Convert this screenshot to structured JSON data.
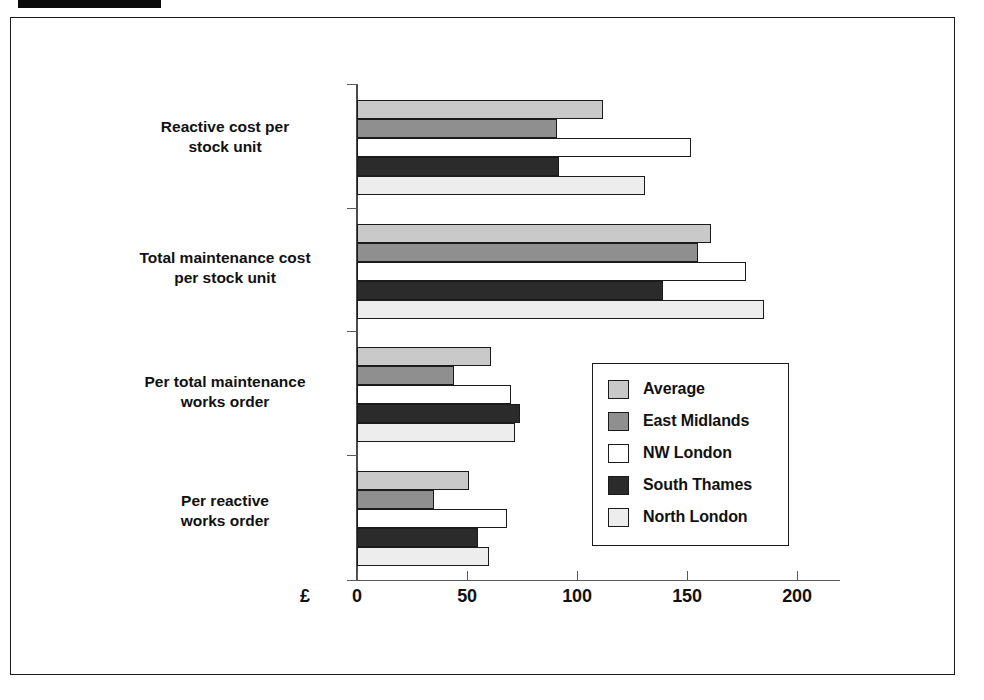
{
  "redaction": {
    "name": "redacted-title-block"
  },
  "chart_data": {
    "type": "bar",
    "orientation": "horizontal",
    "title": "",
    "xlabel": "£",
    "ylabel": "",
    "xlim": [
      0,
      225
    ],
    "grid": false,
    "legend_position": "inside-right",
    "currency_symbol": "£",
    "tick_labels": [
      "0",
      "50",
      "100",
      "150",
      "200"
    ],
    "tick_values": [
      0,
      50,
      100,
      150,
      200
    ],
    "categories": [
      "Reactive cost per stock unit",
      "Total maintenance cost per stock unit",
      "Per total maintenance works order",
      "Per reactive works order"
    ],
    "category_lines": [
      [
        "Reactive cost per",
        "stock unit"
      ],
      [
        "Total maintenance cost",
        "per stock unit"
      ],
      [
        "Per total maintenance",
        "works order"
      ],
      [
        "Per reactive",
        "works order"
      ]
    ],
    "series": [
      {
        "name": "Average",
        "color": "#c9c9c9",
        "values": [
          112,
          161,
          61,
          51
        ]
      },
      {
        "name": "East Midlands",
        "color": "#8f8f8f",
        "values": [
          91,
          155,
          44,
          35
        ]
      },
      {
        "name": "NW London",
        "color": "#ffffff",
        "values": [
          152,
          177,
          70,
          68
        ]
      },
      {
        "name": "South Thames",
        "color": "#2b2b2b",
        "values": [
          92,
          139,
          74,
          55
        ]
      },
      {
        "name": "North London",
        "color": "#ededed",
        "values": [
          131,
          185,
          72,
          60
        ]
      }
    ]
  },
  "legend": {
    "items": [
      {
        "label": "Average",
        "swatch": "swatch-average"
      },
      {
        "label": "East Midlands",
        "swatch": "swatch-east-midlands"
      },
      {
        "label": "NW London",
        "swatch": "swatch-nw-london"
      },
      {
        "label": "South Thames",
        "swatch": "swatch-south-thames"
      },
      {
        "label": "North London",
        "swatch": "swatch-north-london"
      }
    ]
  }
}
